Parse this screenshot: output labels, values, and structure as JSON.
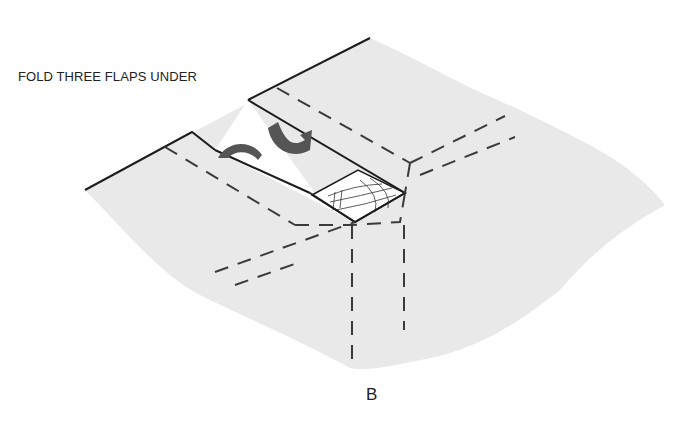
{
  "diagram": {
    "instruction": "FOLD THREE FLAPS UNDER",
    "figure_label": "B",
    "colors": {
      "paper": "#e9e9e9",
      "flap": "#ffffff",
      "outline": "#1c1c1c",
      "fold_line": "#3a3a3a",
      "arrow": "#555555"
    },
    "elements": [
      "paper-sheet",
      "upper-flap",
      "left-flap",
      "corner-fabric-patch",
      "dashed-fold-lines",
      "curved-fold-arrows"
    ]
  }
}
